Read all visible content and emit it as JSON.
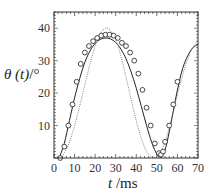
{
  "chart_data": {
    "type": "line",
    "title": "",
    "xlabel": "t /ms",
    "xlabel_var": "t",
    "xlabel_unit": " /ms",
    "ylabel": "θ (t)/°",
    "ylabel_var": "θ (t)",
    "ylabel_unit": "/°",
    "xlim": [
      0,
      70
    ],
    "ylim": [
      0,
      45
    ],
    "xticks": [
      0,
      10,
      20,
      30,
      40,
      50,
      60,
      70
    ],
    "yticks": [
      10,
      20,
      30,
      40
    ],
    "xtick_labels": [
      "0",
      "10",
      "20",
      "30",
      "40",
      "50",
      "60",
      "70"
    ],
    "ytick_labels": [
      "10",
      "20",
      "30",
      "40"
    ],
    "grid": false,
    "legend": null,
    "series": [
      {
        "name": "experiment",
        "style": "circles",
        "x": [
          3,
          5,
          7,
          9,
          11,
          13,
          15,
          17,
          19,
          21,
          23,
          25,
          27,
          29,
          31,
          33,
          35,
          37,
          39,
          41,
          43,
          45,
          47,
          49,
          51,
          52,
          53,
          54,
          56,
          58,
          60
        ],
        "y": [
          0,
          3.5,
          10,
          16.5,
          23.5,
          29,
          32.5,
          34.5,
          36,
          37,
          37.7,
          38,
          38,
          37.7,
          37,
          35.5,
          34.5,
          32.5,
          30,
          26,
          21,
          15.5,
          10,
          4.5,
          1.5,
          1,
          2,
          5,
          10,
          16.5,
          23.5
        ]
      },
      {
        "name": "model-solid",
        "style": "solid",
        "x": [
          2.5,
          5,
          7.5,
          10,
          12.5,
          15,
          17.5,
          20,
          22.5,
          25,
          27.5,
          30,
          32.5,
          35,
          37.5,
          40,
          42.5,
          45,
          47.5,
          50,
          52,
          54,
          56,
          58,
          60,
          62.5,
          65,
          67.5,
          70
        ],
        "y": [
          0,
          4.5,
          11.5,
          18.5,
          24.5,
          29.5,
          33,
          35.3,
          36.6,
          37,
          36.7,
          35.6,
          33.6,
          30.6,
          26.5,
          21.5,
          15.8,
          10,
          4.8,
          1.2,
          0.3,
          2.5,
          8,
          14.5,
          21,
          27.5,
          31.5,
          34,
          35
        ]
      },
      {
        "name": "model-dotted",
        "style": "dotted",
        "x": [
          3,
          5,
          7.5,
          10,
          12.5,
          15,
          17.5,
          20,
          22.5,
          25,
          27.5,
          30,
          32.5,
          35,
          37.5,
          40,
          42.5,
          45,
          47.5,
          50,
          52.5,
          55,
          57.5,
          60,
          62.5,
          65,
          67.5,
          70
        ],
        "y": [
          0,
          1.5,
          5,
          10,
          16,
          22.5,
          29,
          34.5,
          38.3,
          40,
          39.3,
          36.5,
          31.5,
          25,
          18,
          11.5,
          6,
          2,
          0.3,
          0.3,
          2.5,
          7,
          13,
          19.5,
          25.5,
          30.5,
          34,
          36
        ]
      }
    ]
  },
  "colors": {
    "axis": "#333333",
    "solid_line": "#222222",
    "dotted_line": "#666666",
    "marker_edge": "#333333"
  }
}
